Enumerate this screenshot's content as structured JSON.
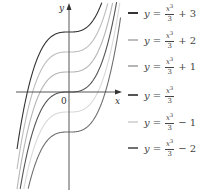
{
  "chart_data": {
    "type": "line",
    "title": "",
    "xlabel": "x",
    "ylabel": "y",
    "origin_label": "0",
    "xlim": [
      -2.6,
      2.6
    ],
    "ylim": [
      -4.9,
      4.4
    ],
    "grid": false,
    "legend_position": "right",
    "series": [
      {
        "name": "y = x^3/3 + 3",
        "shift": 3,
        "color": "#333333"
      },
      {
        "name": "y = x^3/3 + 2",
        "shift": 2,
        "color": "#bdbdbd"
      },
      {
        "name": "y = x^3/3 + 1",
        "shift": 1,
        "color": "#b5b5b5"
      },
      {
        "name": "y = x^3/3",
        "shift": 0,
        "color": "#555555"
      },
      {
        "name": "y = x^3/3 - 1",
        "shift": -1,
        "color": "#d9d9d9"
      },
      {
        "name": "y = x^3/3 - 2",
        "shift": -2,
        "color": "#707070"
      }
    ]
  },
  "legend": {
    "items": [
      {
        "y": "y",
        "eq": "=",
        "num": "x",
        "exp": "3",
        "den": "3",
        "rest": "+ 3",
        "color": "#333333"
      },
      {
        "y": "y",
        "eq": "=",
        "num": "x",
        "exp": "3",
        "den": "3",
        "rest": "+ 2",
        "color": "#bdbdbd"
      },
      {
        "y": "y",
        "eq": "=",
        "num": "x",
        "exp": "3",
        "den": "3",
        "rest": "+ 1",
        "color": "#b5b5b5"
      },
      {
        "y": "y",
        "eq": "=",
        "num": "x",
        "exp": "3",
        "den": "3",
        "rest": "",
        "color": "#555555"
      },
      {
        "y": "y",
        "eq": "=",
        "num": "x",
        "exp": "3",
        "den": "3",
        "rest": "− 1",
        "color": "#d9d9d9"
      },
      {
        "y": "y",
        "eq": "=",
        "num": "x",
        "exp": "3",
        "den": "3",
        "rest": "− 2",
        "color": "#707070"
      }
    ]
  }
}
